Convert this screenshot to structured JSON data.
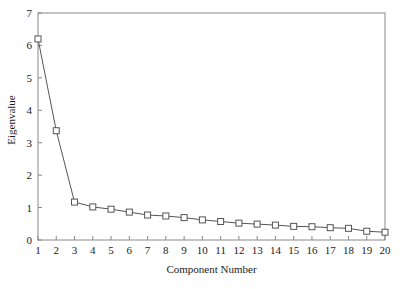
{
  "chart_data": {
    "type": "line",
    "title": "",
    "xlabel": "Component Number",
    "ylabel": "Eigenvalue",
    "x": [
      1,
      2,
      3,
      4,
      5,
      6,
      7,
      8,
      9,
      10,
      11,
      12,
      13,
      14,
      15,
      16,
      17,
      18,
      19,
      20
    ],
    "values": [
      6.2,
      3.37,
      1.17,
      1.02,
      0.95,
      0.86,
      0.77,
      0.74,
      0.69,
      0.62,
      0.57,
      0.52,
      0.49,
      0.46,
      0.42,
      0.41,
      0.38,
      0.36,
      0.27,
      0.24
    ],
    "categories": [
      "1",
      "2",
      "3",
      "4",
      "5",
      "6",
      "7",
      "8",
      "9",
      "10",
      "11",
      "12",
      "13",
      "14",
      "15",
      "16",
      "17",
      "18",
      "19",
      "20"
    ],
    "xlim": [
      1,
      20
    ],
    "ylim": [
      0,
      7
    ],
    "xticks": [
      "1",
      "2",
      "3",
      "4",
      "5",
      "6",
      "7",
      "8",
      "9",
      "10",
      "11",
      "12",
      "13",
      "14",
      "15",
      "16",
      "17",
      "18",
      "19",
      "20"
    ],
    "yticks": [
      "0",
      "1",
      "2",
      "3",
      "4",
      "5",
      "6",
      "7"
    ],
    "grid": false,
    "legend": "none",
    "marker": "open-square",
    "line_color": "#555555",
    "marker_fill": "#ffffff",
    "marker_edge": "#555555",
    "axis_color": "#888888",
    "tick_direction": "in"
  },
  "axes": {
    "y_title": "Eigenvalue",
    "x_title": "Component Number"
  }
}
